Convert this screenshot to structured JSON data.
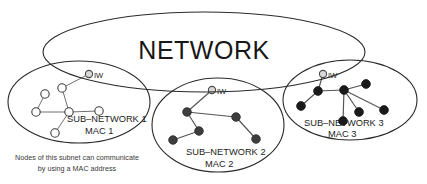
{
  "diagram": {
    "title": "NETWORK",
    "type": "network-topology-diagram",
    "network_ellipse": {
      "label": "NETWORK",
      "cx": 204,
      "cy": 52,
      "rx": 161,
      "ry": 40
    },
    "subnets": [
      {
        "id": "subnet-1",
        "label": "SUB–NETWORK 1",
        "mac_label": "MAC 1",
        "node_style": "hollow",
        "node_count": 6,
        "gateway_label": "IW",
        "ellipse": {
          "cx": 79,
          "cy": 102,
          "rx": 71,
          "ry": 41
        },
        "label_pos": {
          "x": 67,
          "y": 122
        },
        "mac_pos": {
          "x": 85,
          "y": 134
        },
        "gateway": {
          "x": 89,
          "y": 74
        },
        "nodes": [
          {
            "x": 45,
            "y": 94
          },
          {
            "x": 36,
            "y": 112
          },
          {
            "x": 62,
            "y": 88
          },
          {
            "x": 69,
            "y": 112
          },
          {
            "x": 99,
            "y": 111
          },
          {
            "x": 55,
            "y": 133
          }
        ],
        "edges": [
          [
            0,
            1
          ],
          [
            1,
            3
          ],
          [
            2,
            3
          ],
          [
            3,
            4
          ],
          [
            3,
            5
          ],
          [
            2,
            6
          ]
        ]
      },
      {
        "id": "subnet-2",
        "label": "SUB–NETWORK 2",
        "mac_label": "MAC 2",
        "node_style": "filled-gray",
        "node_count": 5,
        "gateway_label": "IW",
        "ellipse": {
          "cx": 218,
          "cy": 125,
          "rx": 66,
          "ry": 47
        },
        "label_pos": {
          "x": 186,
          "y": 155
        },
        "mac_pos": {
          "x": 205,
          "y": 167
        },
        "gateway": {
          "x": 212,
          "y": 90
        },
        "nodes": [
          {
            "x": 187,
            "y": 112
          },
          {
            "x": 199,
            "y": 131
          },
          {
            "x": 173,
            "y": 140
          },
          {
            "x": 236,
            "y": 117
          },
          {
            "x": 256,
            "y": 139
          }
        ],
        "edges": [
          [
            0,
            1
          ],
          [
            1,
            2
          ],
          [
            0,
            3
          ],
          [
            3,
            4
          ],
          [
            0,
            5
          ]
        ]
      },
      {
        "id": "subnet-3",
        "label": "SUB–NETWORK 3",
        "mac_label": "MAC 3",
        "node_style": "filled",
        "node_count": 7,
        "gateway_label": "IW",
        "ellipse": {
          "cx": 350,
          "cy": 100,
          "rx": 67,
          "ry": 40
        },
        "label_pos": {
          "x": 304,
          "y": 126
        },
        "mac_pos": {
          "x": 328,
          "y": 137
        },
        "gateway": {
          "x": 323,
          "y": 74
        },
        "nodes": [
          {
            "x": 318,
            "y": 91
          },
          {
            "x": 301,
            "y": 106
          },
          {
            "x": 344,
            "y": 90
          },
          {
            "x": 366,
            "y": 84
          },
          {
            "x": 359,
            "y": 112
          },
          {
            "x": 343,
            "y": 121
          },
          {
            "x": 384,
            "y": 110
          }
        ],
        "edges": [
          [
            0,
            1
          ],
          [
            0,
            2
          ],
          [
            2,
            3
          ],
          [
            2,
            4
          ],
          [
            2,
            5
          ],
          [
            2,
            6
          ],
          [
            0,
            7
          ]
        ]
      }
    ],
    "caption": {
      "line1": "Nodes of this subnet can communicate",
      "line2": "by using a MAC address",
      "x": 77,
      "y1": 160,
      "y2": 171
    }
  },
  "colors": {
    "stroke": "#2b2b2b",
    "node_hollow_fill": "#ffffff",
    "node_filled_fill": "#1a1a1a",
    "node_gray_fill": "#3d3d3d",
    "gateway_fill": "#d8d8d8",
    "link": "#6f6f6f",
    "background": "#ffffff",
    "text": "#1c1c1c"
  }
}
